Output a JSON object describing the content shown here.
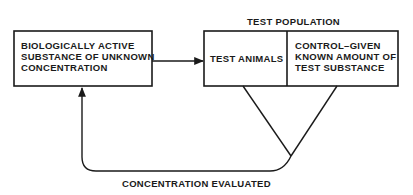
{
  "diagram": {
    "source_box": {
      "lines": [
        "BIOLOGICALLY ACTIVE",
        "SUBSTANCE OF UNKNOWN",
        "CONCENTRATION"
      ]
    },
    "group_label": "TEST POPULATION",
    "test_box": {
      "label": "TEST ANIMALS"
    },
    "control_box": {
      "lines": [
        "CONTROL–GIVEN",
        "KNOWN AMOUNT OF",
        "TEST SUBSTANCE"
      ]
    },
    "feedback_label": "CONCENTRATION EVALUATED",
    "colors": {
      "stroke": "#1a1a1a",
      "background": "#ffffff"
    }
  }
}
